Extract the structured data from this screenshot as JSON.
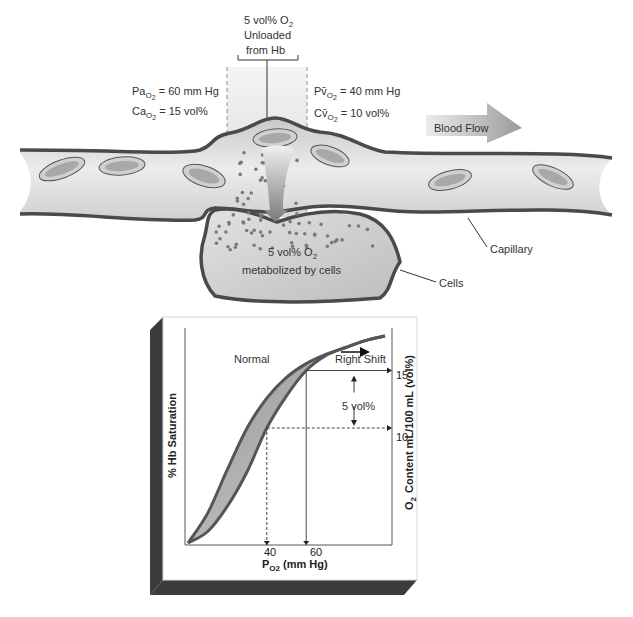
{
  "top_label": {
    "line1": "5 vol% O",
    "line1_sub": "2",
    "line2": "Unloaded",
    "line3": "from Hb"
  },
  "arterial": {
    "pa_prefix": "Pa",
    "pa_sub": "O",
    "pa_sub2": "2",
    "pa_value": " = 60 mm Hg",
    "ca_prefix": "Ca",
    "ca_sub": "O",
    "ca_sub2": "2",
    "ca_value": " = 15 vol%"
  },
  "venous": {
    "pv_prefix": "Pv̄",
    "pv_sub": "O",
    "pv_sub2": "2",
    "pv_value": " = 40 mm Hg",
    "cv_prefix": "Cv̄",
    "cv_sub": "O",
    "cv_sub2": "2",
    "cv_value": " = 10 vol%"
  },
  "blood_flow_label": "Blood Flow",
  "cells_text": {
    "line1": "5 vol% O",
    "line1_sub": "2",
    "line2": "metabolized by cells"
  },
  "callouts": {
    "capillary": "Capillary",
    "cells": "Cells"
  },
  "colors": {
    "vessel_wall": "#4a4a4a",
    "vessel_fill": "#d6d6d6",
    "cell_fill": "#c4c4c4",
    "dot": "#7a7a7a",
    "curve_band": "#9a9a9a",
    "panel_shadow": "#3c3c3c"
  },
  "chart_data": {
    "type": "line",
    "title": "",
    "xlabel": "P",
    "xlabel_sub": "O2",
    "xlabel_unit": " (mm Hg)",
    "ylabel_left": "% Hb Saturation",
    "ylabel_right_prefix": "O",
    "ylabel_right_sub": "2",
    "ylabel_right": "Content mL/100 mL (vol%)",
    "x_ticks": [
      "40",
      "60"
    ],
    "x_tick_values": [
      40,
      60
    ],
    "y_right_ticks": [
      "15",
      "10"
    ],
    "y_right_tick_values": [
      15,
      10
    ],
    "xlim": [
      0,
      100
    ],
    "ylim_right": [
      0,
      20
    ],
    "series": [
      {
        "name": "Normal",
        "label": "Normal",
        "x": [
          0,
          10,
          20,
          30,
          40,
          50,
          60,
          70,
          80,
          90,
          100
        ],
        "y": [
          0,
          2.6,
          6.4,
          10.0,
          12.6,
          14.4,
          15.6,
          16.4,
          17.0,
          17.6,
          18.0
        ]
      },
      {
        "name": "Right Shift",
        "label": "Right Shift",
        "x": [
          0,
          10,
          20,
          30,
          40,
          50,
          60,
          70,
          80,
          90,
          100
        ],
        "y": [
          0,
          1.0,
          3.2,
          6.2,
          10.0,
          12.8,
          15.0,
          16.3,
          17.0,
          17.6,
          18.0
        ]
      }
    ],
    "annotations": {
      "delta_label": "5 vol%",
      "delta_from": 10,
      "delta_to": 15,
      "right_shift_arrow": "Right Shift"
    },
    "grid": false,
    "legend": "none"
  }
}
